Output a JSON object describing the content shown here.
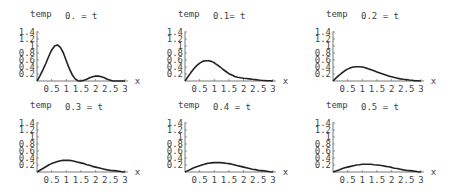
{
  "layout": {
    "rows": 2,
    "cols": 3,
    "origins": [
      [
        37,
        81
      ],
      [
        185,
        81
      ],
      [
        333,
        81
      ],
      [
        37,
        172
      ],
      [
        185,
        172
      ],
      [
        333,
        172
      ]
    ],
    "px_per_x": 29.3,
    "px_per_y": 35,
    "axis_color": "#555555",
    "curve_color": "#222222"
  },
  "chart_data": [
    {
      "type": "line",
      "title": "0. = t",
      "xlabel": "x",
      "ylabel": "temp",
      "xlim": [
        0,
        3
      ],
      "ylim": [
        0,
        1.4
      ],
      "xticks": [
        "0.5",
        "1",
        "1.5",
        "2",
        "2.5",
        "3"
      ],
      "yticks": [
        "0.2",
        "0.4",
        "0.6",
        "0.8",
        "1",
        "1.2",
        "1.4"
      ],
      "x": [
        0,
        0.1,
        0.2,
        0.3,
        0.4,
        0.5,
        0.6,
        0.7,
        0.8,
        0.9,
        1.0,
        1.1,
        1.2,
        1.3,
        1.4,
        1.5,
        1.6,
        1.7,
        1.8,
        1.9,
        2.0,
        2.1,
        2.2,
        2.3,
        2.4,
        2.5,
        2.6,
        2.7,
        2.8,
        2.9,
        3.0
      ],
      "y": [
        0,
        0.15,
        0.32,
        0.5,
        0.7,
        0.88,
        1.0,
        1.03,
        0.96,
        0.8,
        0.58,
        0.36,
        0.18,
        0.06,
        0.01,
        0.0,
        0.02,
        0.05,
        0.09,
        0.12,
        0.14,
        0.14,
        0.12,
        0.09,
        0.05,
        0.02,
        0.0,
        0.0,
        0.0,
        0.0,
        0.0
      ]
    },
    {
      "type": "line",
      "title": "0.1= t",
      "xlabel": "x",
      "ylabel": "temp",
      "xlim": [
        0,
        3
      ],
      "ylim": [
        0,
        1.4
      ],
      "xticks": [
        "0.5",
        "1",
        "1.5",
        "2",
        "2.5",
        "3"
      ],
      "yticks": [
        "0.2",
        "0.4",
        "0.6",
        "0.8",
        "1",
        "1.2",
        "1.4"
      ],
      "x": [
        0,
        0.1,
        0.2,
        0.3,
        0.4,
        0.5,
        0.6,
        0.7,
        0.8,
        0.9,
        1.0,
        1.1,
        1.2,
        1.3,
        1.4,
        1.5,
        1.6,
        1.7,
        1.8,
        1.9,
        2.0,
        2.1,
        2.2,
        2.3,
        2.4,
        2.5,
        2.6,
        2.7,
        2.8,
        2.9,
        3.0
      ],
      "y": [
        0,
        0.12,
        0.24,
        0.35,
        0.44,
        0.51,
        0.56,
        0.58,
        0.58,
        0.56,
        0.52,
        0.46,
        0.4,
        0.33,
        0.27,
        0.21,
        0.17,
        0.13,
        0.11,
        0.09,
        0.08,
        0.07,
        0.06,
        0.05,
        0.04,
        0.03,
        0.02,
        0.015,
        0.01,
        0.005,
        0.0
      ]
    },
    {
      "type": "line",
      "title": "0.2 = t",
      "xlabel": "x",
      "ylabel": "temp",
      "xlim": [
        0,
        3
      ],
      "ylim": [
        0,
        1.4
      ],
      "xticks": [
        "0.5",
        "1",
        "1.5",
        "2",
        "2.5",
        "3"
      ],
      "yticks": [
        "0.2",
        "0.4",
        "0.6",
        "0.8",
        "1",
        "1.2",
        "1.4"
      ],
      "x": [
        0,
        0.1,
        0.2,
        0.3,
        0.4,
        0.5,
        0.6,
        0.7,
        0.8,
        0.9,
        1.0,
        1.1,
        1.2,
        1.3,
        1.4,
        1.5,
        1.6,
        1.7,
        1.8,
        1.9,
        2.0,
        2.1,
        2.2,
        2.3,
        2.4,
        2.5,
        2.6,
        2.7,
        2.8,
        2.9,
        3.0
      ],
      "y": [
        0,
        0.08,
        0.16,
        0.23,
        0.29,
        0.34,
        0.38,
        0.4,
        0.41,
        0.41,
        0.4,
        0.38,
        0.35,
        0.32,
        0.29,
        0.26,
        0.23,
        0.2,
        0.17,
        0.14,
        0.12,
        0.1,
        0.08,
        0.06,
        0.05,
        0.04,
        0.03,
        0.02,
        0.01,
        0.005,
        0.0
      ]
    },
    {
      "type": "line",
      "title": "0.3 = t",
      "xlabel": "x",
      "ylabel": "temp",
      "xlim": [
        0,
        3
      ],
      "ylim": [
        0,
        1.4
      ],
      "xticks": [
        "0.5",
        "1",
        "1.5",
        "2",
        "2.5",
        "3"
      ],
      "yticks": [
        "0.2",
        "0.4",
        "0.6",
        "0.8",
        "1",
        "1.2",
        "1.4"
      ],
      "x": [
        0,
        0.1,
        0.2,
        0.3,
        0.4,
        0.5,
        0.6,
        0.7,
        0.8,
        0.9,
        1.0,
        1.1,
        1.2,
        1.3,
        1.4,
        1.5,
        1.6,
        1.7,
        1.8,
        1.9,
        2.0,
        2.1,
        2.2,
        2.3,
        2.4,
        2.5,
        2.6,
        2.7,
        2.8,
        2.9,
        3.0
      ],
      "y": [
        0,
        0.05,
        0.1,
        0.15,
        0.2,
        0.24,
        0.27,
        0.3,
        0.32,
        0.33,
        0.33,
        0.33,
        0.32,
        0.3,
        0.28,
        0.26,
        0.24,
        0.21,
        0.19,
        0.16,
        0.14,
        0.12,
        0.1,
        0.08,
        0.06,
        0.05,
        0.04,
        0.03,
        0.02,
        0.01,
        0.0
      ]
    },
    {
      "type": "line",
      "title": "0.4 = t",
      "xlabel": "x",
      "ylabel": "temp",
      "xlim": [
        0,
        3
      ],
      "ylim": [
        0,
        1.4
      ],
      "xticks": [
        "0.5",
        "1",
        "1.5",
        "2",
        "2.5",
        "3"
      ],
      "yticks": [
        "0.2",
        "0.4",
        "0.6",
        "0.8",
        "1",
        "1.2",
        "1.4"
      ],
      "x": [
        0,
        0.1,
        0.2,
        0.3,
        0.4,
        0.5,
        0.6,
        0.7,
        0.8,
        0.9,
        1.0,
        1.1,
        1.2,
        1.3,
        1.4,
        1.5,
        1.6,
        1.7,
        1.8,
        1.9,
        2.0,
        2.1,
        2.2,
        2.3,
        2.4,
        2.5,
        2.6,
        2.7,
        2.8,
        2.9,
        3.0
      ],
      "y": [
        0,
        0.04,
        0.08,
        0.12,
        0.15,
        0.18,
        0.21,
        0.23,
        0.25,
        0.26,
        0.27,
        0.27,
        0.27,
        0.26,
        0.25,
        0.24,
        0.22,
        0.2,
        0.18,
        0.16,
        0.14,
        0.12,
        0.1,
        0.08,
        0.07,
        0.05,
        0.04,
        0.03,
        0.02,
        0.01,
        0.0
      ]
    },
    {
      "type": "line",
      "title": "0.5 = t",
      "xlabel": "x",
      "ylabel": "temp",
      "xlim": [
        0,
        3
      ],
      "ylim": [
        0,
        1.4
      ],
      "xticks": [
        "0.5",
        "1",
        "1.5",
        "2",
        "2.5",
        "3"
      ],
      "yticks": [
        "0.2",
        "0.4",
        "0.6",
        "0.8",
        "1",
        "1.2",
        "1.4"
      ],
      "x": [
        0,
        0.1,
        0.2,
        0.3,
        0.4,
        0.5,
        0.6,
        0.7,
        0.8,
        0.9,
        1.0,
        1.1,
        1.2,
        1.3,
        1.4,
        1.5,
        1.6,
        1.7,
        1.8,
        1.9,
        2.0,
        2.1,
        2.2,
        2.3,
        2.4,
        2.5,
        2.6,
        2.7,
        2.8,
        2.9,
        3.0
      ],
      "y": [
        0,
        0.03,
        0.06,
        0.09,
        0.12,
        0.14,
        0.16,
        0.18,
        0.2,
        0.21,
        0.22,
        0.22,
        0.22,
        0.22,
        0.21,
        0.2,
        0.19,
        0.18,
        0.16,
        0.15,
        0.13,
        0.11,
        0.1,
        0.08,
        0.06,
        0.05,
        0.04,
        0.03,
        0.02,
        0.01,
        0.0
      ]
    }
  ]
}
